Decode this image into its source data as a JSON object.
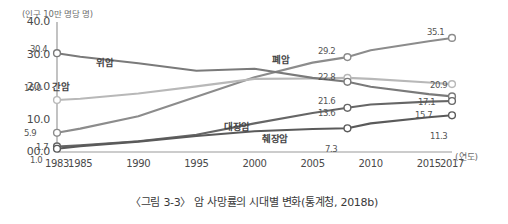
{
  "caption": "〈그림 3-3〉 암 사망률의 시대별 변화(통계청, 2018b)",
  "chart_data": {
    "type": "line",
    "title": "",
    "xlabel": "(연도)",
    "ylabel": "(인구 10만 명당 명)",
    "grid": false,
    "legend": "inline-labels",
    "xlim": [
      1983,
      2017
    ],
    "ylim": [
      0.0,
      40.0
    ],
    "ytick_labels": [
      "40.0",
      "30.0",
      "20.0",
      "10.0",
      "00.0"
    ],
    "ytick_values": [
      40.0,
      30.0,
      20.0,
      10.0,
      0.0
    ],
    "xtick_labels": [
      "1983",
      "1985",
      "1990",
      "1995",
      "2000",
      "2005",
      "2010",
      "2015",
      "2017"
    ],
    "xtick_values": [
      1983,
      1985,
      1990,
      1995,
      2000,
      2005,
      2010,
      2015,
      2017
    ],
    "x": [
      1983,
      1985,
      1990,
      1995,
      2000,
      2005,
      2008,
      2010,
      2015,
      2017
    ],
    "series": [
      {
        "name": "폐암",
        "color": "#8c8c8c",
        "values": [
          5.9,
          7.2,
          11.0,
          17.0,
          23.0,
          27.5,
          29.2,
          31.3,
          34.1,
          35.1
        ],
        "labels": [
          {
            "x": 1983,
            "y": 5.9,
            "text": "5.9"
          },
          {
            "x": 2008,
            "y": 29.2,
            "text": "29.2"
          },
          {
            "x": 2017,
            "y": 35.1,
            "text": "35.1"
          }
        ]
      },
      {
        "name": "간암",
        "color": "#b8b8b8",
        "values": [
          16.0,
          16.4,
          18.0,
          20.2,
          22.5,
          22.6,
          22.8,
          22.5,
          21.4,
          20.9
        ],
        "labels": [
          {
            "x": 1983,
            "y": 16.0,
            "text": "16.0"
          },
          {
            "x": 2008,
            "y": 22.8,
            "text": "22.8"
          },
          {
            "x": 2017,
            "y": 20.9,
            "text": "20.9"
          }
        ]
      },
      {
        "name": "위암",
        "color": "#7a7a7a",
        "values": [
          30.4,
          29.3,
          27.3,
          25.0,
          25.6,
          22.8,
          21.6,
          20.1,
          17.8,
          17.1
        ],
        "labels": [
          {
            "x": 1983,
            "y": 30.4,
            "text": "30.4"
          },
          {
            "x": 2008,
            "y": 21.6,
            "text": "21.6"
          },
          {
            "x": 2017,
            "y": 17.1,
            "text": "17.1"
          }
        ]
      },
      {
        "name": "대장암",
        "color": "#666666",
        "values": [
          1.7,
          2.1,
          3.3,
          5.3,
          8.8,
          12.0,
          13.6,
          14.6,
          15.5,
          15.7
        ],
        "labels": [
          {
            "x": 1983,
            "y": 1.7,
            "text": "1.7"
          },
          {
            "x": 2008,
            "y": 13.6,
            "text": "13.6"
          },
          {
            "x": 2017,
            "y": 15.7,
            "text": "15.7"
          }
        ]
      },
      {
        "name": "췌장암",
        "color": "#5a5a5a",
        "values": [
          1.0,
          1.8,
          3.2,
          4.9,
          6.4,
          7.1,
          7.3,
          8.8,
          10.7,
          11.3
        ],
        "labels": [
          {
            "x": 1983,
            "y": 1.0,
            "text": "1.0"
          },
          {
            "x": 2008,
            "y": 7.3,
            "text": "7.3"
          },
          {
            "x": 2017,
            "y": 11.3,
            "text": "11.3"
          }
        ]
      }
    ],
    "series_label_positions": [
      {
        "name": "위암",
        "left": 96,
        "top": 55
      },
      {
        "name": "간암",
        "left": 52,
        "top": 79
      },
      {
        "name": "폐암",
        "left": 272,
        "top": 52
      },
      {
        "name": "대장암",
        "left": 224,
        "top": 119
      },
      {
        "name": "췌장암",
        "left": 262,
        "top": 131
      }
    ],
    "point_label_positions": [
      {
        "text": "30.4",
        "left": 30,
        "top": 44
      },
      {
        "text": "16.0",
        "left": 24,
        "top": 83
      },
      {
        "text": "5.9",
        "left": 24,
        "top": 128
      },
      {
        "text": "1.7",
        "left": 36,
        "top": 142
      },
      {
        "text": "1.0",
        "left": 30,
        "top": 155
      },
      {
        "text": "29.2",
        "left": 318,
        "top": 46
      },
      {
        "text": "22.8",
        "left": 318,
        "top": 72
      },
      {
        "text": "21.6",
        "left": 318,
        "top": 96
      },
      {
        "text": "13.6",
        "left": 318,
        "top": 108
      },
      {
        "text": "7.3",
        "left": 325,
        "top": 144
      },
      {
        "text": "35.1",
        "left": 427,
        "top": 27
      },
      {
        "text": "20.9",
        "left": 430,
        "top": 80
      },
      {
        "text": "17.1",
        "left": 418,
        "top": 97
      },
      {
        "text": "15.7",
        "left": 415,
        "top": 110
      },
      {
        "text": "11.3",
        "left": 430,
        "top": 131
      }
    ]
  }
}
